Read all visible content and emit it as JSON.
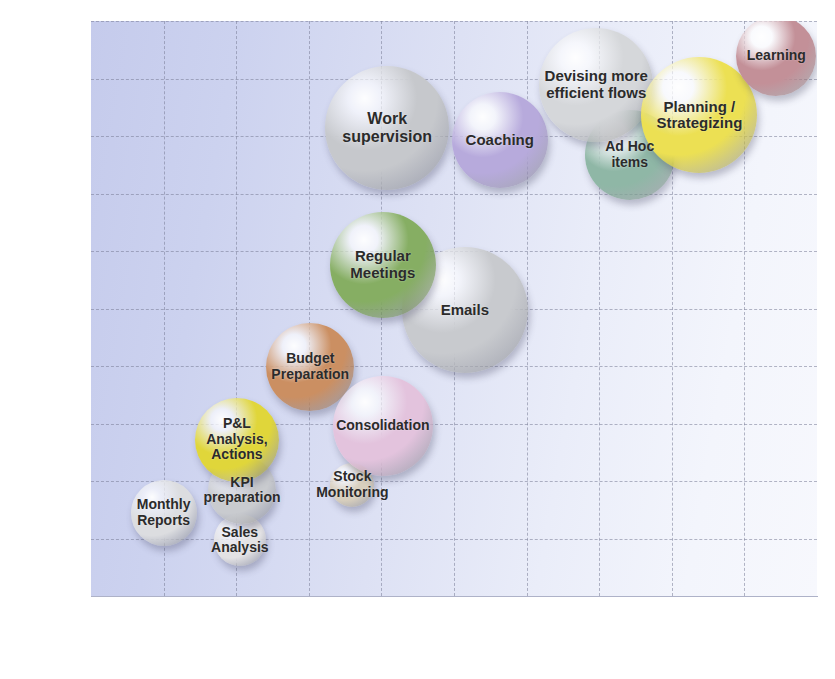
{
  "chart_data": {
    "type": "scatter",
    "title": "",
    "xlabel": "Recurrence",
    "ylabel": "Prone to Replacement",
    "xlim": [
      0,
      10
    ],
    "ylim": [
      0,
      10
    ],
    "xticks": [
      "0",
      "1",
      "2",
      "3",
      "4",
      "5",
      "6",
      "7",
      "8",
      "9",
      "10"
    ],
    "yticks": [
      "0",
      "1",
      "2",
      "3",
      "4",
      "5",
      "6",
      "7",
      "8",
      "9",
      "10"
    ],
    "grid": true,
    "legend": "none",
    "x_axis_anchors": [
      {
        "label": "High",
        "x": 2.0
      },
      {
        "label": "Recurrence",
        "x": 5.0,
        "bold": true
      },
      {
        "label": "Low",
        "x": 8.4
      }
    ],
    "y_axis_anchors": [
      {
        "label": "Low",
        "y": 9.3
      },
      {
        "label": "Prone to Replacement",
        "y": 5.6,
        "bold": true
      },
      {
        "label": "High",
        "y": 1.9
      }
    ],
    "points": [
      {
        "label": "Monthly\nReports",
        "x": 1.0,
        "y": 1.45,
        "r": 33,
        "color": "#dcdde0",
        "fontsize": 14
      },
      {
        "label": "Sales\nAnalysis",
        "x": 2.05,
        "y": 0.97,
        "r": 26,
        "color": "#e3e2e4",
        "fontsize": 14
      },
      {
        "label": "KPI\npreparation",
        "x": 2.08,
        "y": 1.84,
        "r": 34,
        "color": "#c9cbcf",
        "fontsize": 14
      },
      {
        "label": "P&L Analysis,\nActions",
        "x": 2.01,
        "y": 2.72,
        "r": 42,
        "color": "#e0d63a",
        "fontsize": 14
      },
      {
        "label": "Stock\nMonitoring",
        "x": 3.6,
        "y": 1.93,
        "r": 22,
        "color": "#d8cfbd",
        "fontsize": 14
      },
      {
        "label": "Budget\nPreparation",
        "x": 3.02,
        "y": 3.98,
        "r": 44,
        "color": "#cb8f62",
        "fontsize": 14
      },
      {
        "label": "Consolidation",
        "x": 4.02,
        "y": 2.96,
        "r": 50,
        "color": "#e3c3dd",
        "fontsize": 14
      },
      {
        "label": "Emails",
        "x": 5.15,
        "y": 4.97,
        "r": 63,
        "color": "#c8cace",
        "fontsize": 15
      },
      {
        "label": "Regular\nMeetings",
        "x": 4.02,
        "y": 5.76,
        "r": 53,
        "color": "#86ae63",
        "fontsize": 15
      },
      {
        "label": "Work\nsupervision",
        "x": 4.08,
        "y": 8.14,
        "r": 62,
        "color": "#c6c8cc",
        "fontsize": 16
      },
      {
        "label": "Coaching",
        "x": 5.63,
        "y": 7.93,
        "r": 48,
        "color": "#b7aadc",
        "fontsize": 15
      },
      {
        "label": "Ad Hoc\nitems",
        "x": 7.42,
        "y": 7.67,
        "r": 45,
        "color": "#8fb7a6",
        "fontsize": 14
      },
      {
        "label": "Devising more\nefficient flows",
        "x": 6.96,
        "y": 8.89,
        "r": 57,
        "color": "#d5d7da",
        "fontsize": 15
      },
      {
        "label": "Planning /\nStrategizing",
        "x": 8.38,
        "y": 8.36,
        "r": 58,
        "color": "#ece053",
        "fontsize": 15
      },
      {
        "label": "Learning",
        "x": 9.44,
        "y": 9.4,
        "r": 40,
        "color": "#c39098",
        "fontsize": 14
      }
    ]
  }
}
